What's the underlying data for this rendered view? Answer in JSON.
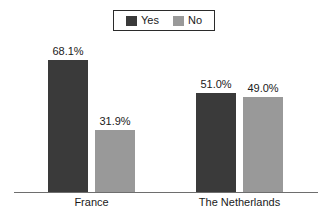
{
  "chart_data": {
    "type": "bar",
    "title": "",
    "subtitle": "",
    "xlabel": "",
    "ylabel": "",
    "categories": [
      "France",
      "The Netherlands"
    ],
    "series": [
      {
        "name": "Yes",
        "values": [
          68.1,
          31.9
        ],
        "color": "#3a3a3a"
      },
      {
        "name": "No",
        "values": [
          51.0,
          49.0
        ],
        "color": "#999999"
      }
    ],
    "series_by_group": [
      {
        "category": "France",
        "Yes": 68.1,
        "No": 31.9
      },
      {
        "category": "The Netherlands",
        "Yes": 51.0,
        "No": 49.0
      }
    ],
    "data_labels": [
      "68.1%",
      "31.9%",
      "51.0%",
      "49.0%"
    ],
    "ylim": [
      0,
      68.1
    ],
    "grid": false,
    "legend_position": "top-center",
    "axis_visible": {
      "x": true,
      "y": false
    },
    "value_suffix": "%"
  },
  "legend": {
    "entries": [
      {
        "label": "Yes",
        "swatch_color": "#3a3a3a",
        "swatch_name": "legend-swatch-yes"
      },
      {
        "label": "No",
        "swatch_color": "#999999",
        "swatch_name": "legend-swatch-no"
      }
    ]
  },
  "bars": [
    {
      "id": "france-yes",
      "group": "France",
      "series": "Yes",
      "value": 68.1,
      "label": "68.1%",
      "color": "#3a3a3a"
    },
    {
      "id": "france-no",
      "group": "France",
      "series": "No",
      "value": 31.9,
      "label": "31.9%",
      "color": "#999999"
    },
    {
      "id": "netherlands-yes",
      "group": "The Netherlands",
      "series": "Yes",
      "value": 51.0,
      "label": "51.0%",
      "color": "#3a3a3a"
    },
    {
      "id": "netherlands-no",
      "group": "The Netherlands",
      "series": "No",
      "value": 49.0,
      "label": "49.0%",
      "color": "#999999"
    }
  ],
  "axis": {
    "categories": [
      {
        "label": "France"
      },
      {
        "label": "The Netherlands"
      }
    ]
  },
  "colors": {
    "background": "#ffffff",
    "series_yes": "#3a3a3a",
    "series_no": "#999999",
    "axis_line": "#6e6e6e",
    "legend_border": "#2b2b2b",
    "text": "#1a1a1a"
  }
}
